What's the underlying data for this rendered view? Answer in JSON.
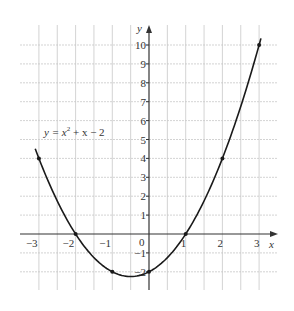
{
  "chart_data": {
    "type": "line",
    "title": "",
    "equation_label": "y = x² + x − 2",
    "equation_parts": {
      "lhs": "y = x",
      "exp": "2",
      "rhs": " + x − 2"
    },
    "xlabel": "x",
    "ylabel": "y",
    "xlim": [
      -3.5,
      3.5
    ],
    "ylim": [
      -2.5,
      11
    ],
    "grid": true,
    "x_ticks": [
      -3,
      -2,
      -1,
      1,
      2,
      3
    ],
    "x_tick_labels": [
      "−3",
      "−2",
      "−1",
      "1",
      "2",
      "3"
    ],
    "y_ticks": [
      10,
      9,
      8,
      7,
      6,
      5,
      4,
      3,
      2,
      1,
      -1,
      -2
    ],
    "y_tick_labels": [
      "10",
      "9",
      "8",
      "7",
      "6",
      "5",
      "4",
      "3",
      "2",
      "1",
      "−1",
      "−2"
    ],
    "origin_label": "0",
    "series": [
      {
        "name": "y = x^2 + x - 2",
        "function": "x^2 + x - 2",
        "domain": [
          -3.1,
          3.05
        ],
        "points": {
          "x": [
            -3,
            -2,
            -1,
            0,
            1,
            2,
            3
          ],
          "y": [
            4,
            0,
            -2,
            -2,
            0,
            4,
            10
          ]
        }
      }
    ]
  },
  "style": {
    "curve_color": "#1a1a1a",
    "grid_color": "#c8c8c8",
    "axis_color": "#333333"
  }
}
